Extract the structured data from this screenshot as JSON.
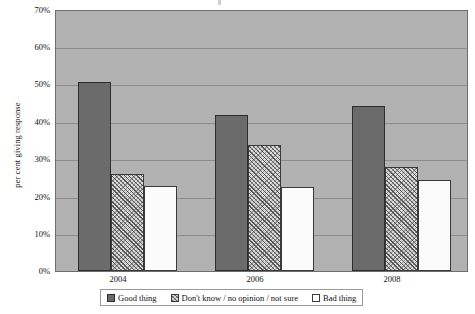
{
  "chart_data": {
    "type": "bar",
    "title": "",
    "subtitle": "",
    "xlabel": "",
    "ylabel": "per cent giving response",
    "categories": [
      "2004",
      "2006",
      "2008"
    ],
    "series": [
      {
        "name": "Good thing",
        "values": [
          51,
          42,
          44.5
        ],
        "color": "#6b6b6b"
      },
      {
        "name": "Don't know / no opinion / not sure",
        "values": [
          26,
          34,
          28
        ],
        "color": "#d8d8d8"
      },
      {
        "name": "Bad thing",
        "values": [
          23,
          22.5,
          24.5
        ],
        "color": "#ffffff"
      }
    ],
    "ylim": [
      0,
      70
    ],
    "y_ticks": [
      0,
      10,
      20,
      30,
      40,
      50,
      60,
      70
    ],
    "y_tick_labels": [
      "0%",
      "10%",
      "20%",
      "30%",
      "40%",
      "50%",
      "60%",
      "70%"
    ],
    "grid": true,
    "legend_position": "bottom",
    "plot_background": "#b2b2b2"
  },
  "legend": {
    "entries": [
      {
        "label": "Good thing",
        "swatch": "good"
      },
      {
        "label": "Don't know / no opinion / not sure",
        "swatch": "dontknow"
      },
      {
        "label": "Bad thing",
        "swatch": "bad"
      }
    ]
  },
  "axes": {
    "y_title": "per cent giving response",
    "y_labels": [
      "70%",
      "60%",
      "50%",
      "40%",
      "30%",
      "20%",
      "10%",
      "0%"
    ],
    "x_labels": [
      "2004",
      "2006",
      "2008"
    ]
  }
}
